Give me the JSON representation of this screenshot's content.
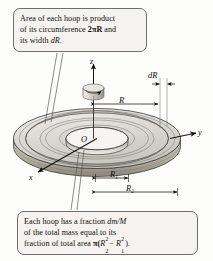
{
  "figure": {
    "type": "physics-diagram",
    "callout_top": {
      "line1": "Area of each hoop is product",
      "line2_a": "of its circumference ",
      "line2_pi": "2πR",
      "line2_b": " and",
      "line3_a": "its width ",
      "line3_b": "dR",
      "line3_c": "."
    },
    "callout_bottom": {
      "line1_a": "Each hoop has a fraction ",
      "line1_b": "dm/M",
      "line2": "of the total mass equal to its",
      "line3_a": "fraction of total area ",
      "line3_pi": "π(",
      "line3_r2": "R",
      "line3_r2_sub": "2",
      "line3_r2_sup": "2",
      "line3_minus": "− ",
      "line3_r1": "R",
      "line3_r1_sub": "1",
      "line3_r1_sup": "2",
      "line3_close": ")."
    },
    "axes": {
      "z": "z",
      "y": "y",
      "x": "x",
      "origin": "O"
    },
    "dimensions": {
      "radius": "R",
      "width": "dR",
      "inner_radius": "R",
      "inner_radius_sub": "1",
      "outer_radius": "R",
      "outer_radius_sub": "2"
    },
    "colors": {
      "disk_top": "#d9d7d2",
      "disk_edge": "#b9b3a6",
      "disk_highlight": "#efeeea",
      "outline": "#3b3a37",
      "callout_fill": "#f4f3f0",
      "callout_border": "#6e6e6e",
      "text": "#13100d",
      "leader_line": "#5a5a58"
    }
  }
}
